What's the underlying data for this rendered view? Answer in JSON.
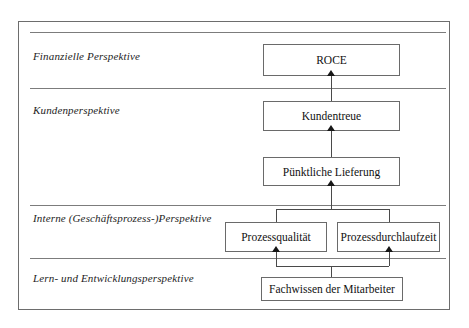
{
  "diagram": {
    "type": "strategy-map",
    "lanes": [
      {
        "id": "financial",
        "label": "Finanzielle Perspektive"
      },
      {
        "id": "customer",
        "label": "Kundenperspektive"
      },
      {
        "id": "internal",
        "label": "Interne (Geschäftsprozess-)Perspektive"
      },
      {
        "id": "learning",
        "label": "Lern- und Entwicklungsperspektive"
      }
    ],
    "nodes": [
      {
        "id": "roce",
        "label": "ROCE",
        "lane": "financial"
      },
      {
        "id": "kundentreue",
        "label": "Kundentreue",
        "lane": "customer"
      },
      {
        "id": "lieferung",
        "label": "Pünktliche Lieferung",
        "lane": "customer"
      },
      {
        "id": "qualitaet",
        "label": "Prozessqualität",
        "lane": "internal"
      },
      {
        "id": "durchlaufzeit",
        "label": "Prozessdurchlaufzeit",
        "lane": "internal"
      },
      {
        "id": "fachwissen",
        "label": "Fachwissen der Mitarbeiter",
        "lane": "learning"
      }
    ],
    "edges": [
      {
        "from": "kundentreue",
        "to": "roce"
      },
      {
        "from": "lieferung",
        "to": "kundentreue"
      },
      {
        "from": "qualitaet",
        "to": "lieferung"
      },
      {
        "from": "durchlaufzeit",
        "to": "lieferung"
      },
      {
        "from": "fachwissen",
        "to": "qualitaet"
      },
      {
        "from": "fachwissen",
        "to": "durchlaufzeit"
      }
    ],
    "colors": {
      "background": "#ffffff",
      "frame_border": "#6d6d6d",
      "divider": "#7c7c7c",
      "node_border": "#6a6a6a",
      "connector": "#4a4a4a",
      "text": "#111111"
    }
  }
}
